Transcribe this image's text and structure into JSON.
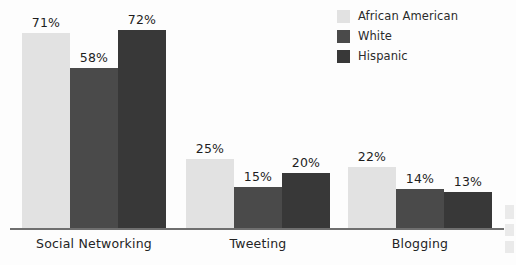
{
  "legend": {
    "position": "top-right",
    "items": [
      {
        "label": "African American",
        "color": "#e2e2e2"
      },
      {
        "label": "White",
        "color": "#4a4a4a"
      },
      {
        "label": "Hispanic",
        "color": "#383838"
      }
    ]
  },
  "chart_data": {
    "type": "bar",
    "title": "",
    "subtitle": "",
    "xlabel": "",
    "ylabel": "",
    "ylim": [
      0,
      80
    ],
    "grid": false,
    "legend_position": "top-right",
    "value_suffix": "%",
    "categories": [
      "Social Networking",
      "Tweeting",
      "Blogging"
    ],
    "series": [
      {
        "name": "African American",
        "color": "#e2e2e2",
        "values": [
          71,
          25,
          22
        ]
      },
      {
        "name": "White",
        "color": "#4a4a4a",
        "values": [
          58,
          15,
          14
        ]
      },
      {
        "name": "Hispanic",
        "color": "#383838",
        "values": [
          72,
          20,
          13
        ]
      }
    ],
    "labels": {
      "Social Networking": [
        "71%",
        "58%",
        "72%"
      ],
      "Tweeting": [
        "25%",
        "15%",
        "20%"
      ],
      "Blogging": [
        "22%",
        "14%",
        "13%"
      ]
    }
  },
  "axis": {
    "baseline_color": "#6f6f6f"
  }
}
